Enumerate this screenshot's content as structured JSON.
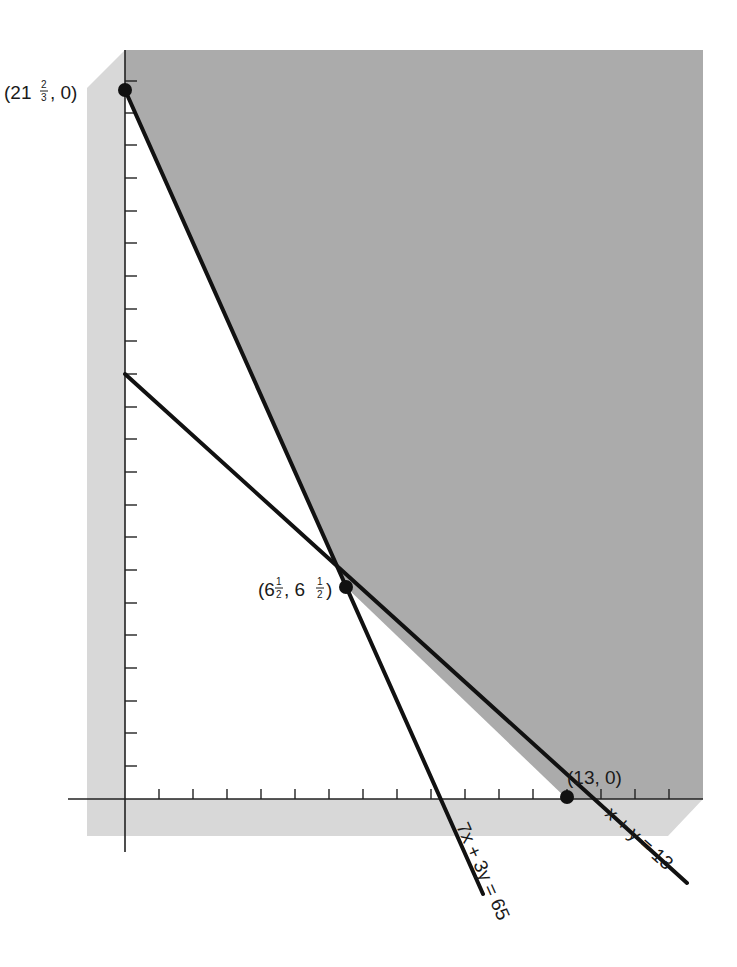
{
  "diagram": {
    "type": "linear-programming-feasible-region",
    "axes": {
      "x_ticks": 17,
      "y_ticks": 22,
      "x_unit_px": 34,
      "y_unit_px": 32.7
    },
    "lines": [
      {
        "id": "line-7x-3y",
        "equation": "7x + 3y = 65"
      },
      {
        "id": "line-x-y",
        "equation": "x + y = 13"
      }
    ],
    "points": [
      {
        "id": "point-top",
        "label_main": "(21",
        "label_num": "2",
        "label_den": "3",
        "label_tail": ", 0)"
      },
      {
        "id": "point-intersection",
        "label": "(6½, 6½)",
        "label_a": "(6",
        "label_b": ", 6",
        "label_c": ")",
        "frac_num": "1",
        "frac_den": "2"
      },
      {
        "id": "point-x-intercept",
        "label": "(13, 0)"
      }
    ],
    "colors": {
      "feasible_shade": "#a9a9a9",
      "frame_shade": "#d6d6d6",
      "line": "#111111",
      "background": "#ffffff"
    }
  }
}
